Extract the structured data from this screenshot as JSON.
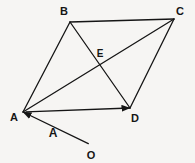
{
  "figure": {
    "type": "geometry-diagram",
    "canvas": {
      "width": 195,
      "height": 163
    },
    "background_color": "#f6f5f3",
    "stroke_color": "#151515",
    "label_color": "#151515"
  },
  "points": {
    "A": {
      "label": "A",
      "x": 23,
      "y": 112,
      "label_x": 14,
      "label_y": 117
    },
    "B": {
      "label": "B",
      "x": 70,
      "y": 22,
      "label_x": 64,
      "label_y": 11
    },
    "C": {
      "label": "C",
      "x": 174,
      "y": 19,
      "label_x": 180,
      "label_y": 11
    },
    "D": {
      "label": "D",
      "x": 130,
      "y": 108,
      "label_x": 135,
      "label_y": 118
    },
    "E": {
      "label": "E",
      "x": 98,
      "y": 62,
      "label_x": 100,
      "label_y": 53
    },
    "O": {
      "label": "O",
      "x": 91,
      "y": 145,
      "label_x": 91,
      "label_y": 155
    }
  },
  "vector_label": {
    "label": "A",
    "x": 53,
    "y": 133
  },
  "segments": [
    {
      "name": "side-AB",
      "from": "A",
      "to": "B",
      "arrow": false
    },
    {
      "name": "side-BC",
      "from": "B",
      "to": "C",
      "arrow": false
    },
    {
      "name": "side-CD",
      "from": "C",
      "to": "D",
      "arrow": false
    },
    {
      "name": "side-AD",
      "from": "A",
      "to": "D",
      "arrow": true
    },
    {
      "name": "diagonal-AC",
      "from": "A",
      "to": "C",
      "arrow": false
    },
    {
      "name": "diagonal-BD",
      "from": "B",
      "to": "D",
      "arrow": false
    },
    {
      "name": "vector-OA",
      "from": "O",
      "to": "A",
      "arrow": true
    }
  ]
}
